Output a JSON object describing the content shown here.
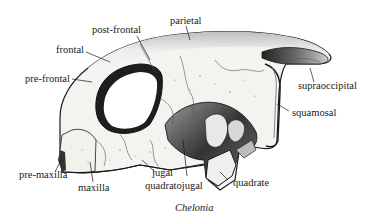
{
  "diagram": {
    "caption": "Chelonia",
    "labels": {
      "parietal": "parietal",
      "post_frontal": "post-frontal",
      "frontal": "frontal",
      "pre_frontal": "pre-frontal",
      "supraoccipital": "supraoccipital",
      "squamosal": "squamosal",
      "pre_maxilla": "pre-maxilla",
      "maxilla": "maxilla",
      "jugal": "jugal",
      "quadratojugal": "quadratojugal",
      "quadrate": "quadrate"
    },
    "colors": {
      "ink": "#1a1a1a",
      "bone": "#f4f2ee",
      "shade": "#8a8a8a",
      "dark": "#222222",
      "background": "#ffffff"
    }
  }
}
